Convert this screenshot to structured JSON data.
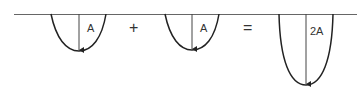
{
  "diagram": {
    "pulse_left": {
      "label": "A"
    },
    "operator_plus": "+",
    "pulse_middle": {
      "label": "A"
    },
    "operator_equals": "=",
    "pulse_result": {
      "label": "2A"
    },
    "colors": {
      "line": "#333333",
      "baseline": "#555555"
    }
  }
}
